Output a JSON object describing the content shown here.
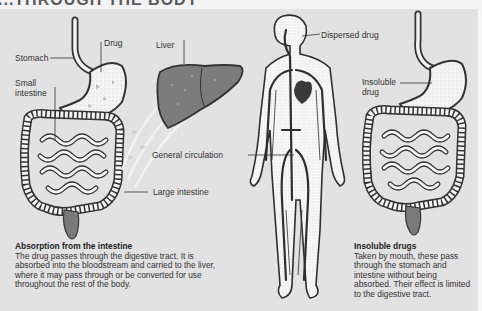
{
  "title": "...THROUGH THE BODY",
  "labels": {
    "stomach": "Stomach",
    "drug": "Drug",
    "small_intestine_1": "Small",
    "small_intestine_2": "intestine",
    "liver": "Liver",
    "dispersed_drug": "Dispersed drug",
    "general_circulation": "General circulation",
    "large_intestine": "Large intestine",
    "insoluble_drug_1": "Insoluble",
    "insoluble_drug_2": "drug"
  },
  "captions": {
    "absorption": {
      "heading": "Absorption from the intestine",
      "body": "The drug passes through the digestive tract. It is absorbed into the bloodstream and carried to the liver, where it may pass through or be converted for use throughout the rest of the body."
    },
    "insoluble": {
      "heading": "Insoluble drugs",
      "body": "Taken by mouth, these pass through the stomach and intestine without being absorbed. Their effect is limited to the digestive tract."
    }
  },
  "colors": {
    "background": "#e2e2e2",
    "organ_fill": "#f4f4f4",
    "dark_fill": "#7a7a7a",
    "outline": "#333333",
    "vessel": "#2e2e2e"
  }
}
